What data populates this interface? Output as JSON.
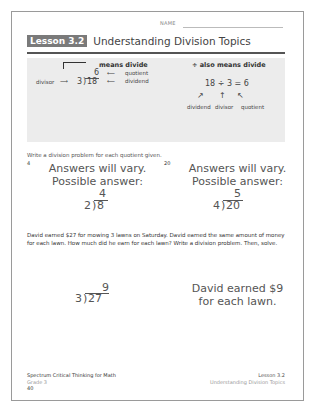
{
  "header": {
    "name_label": "NAME",
    "lesson_badge": "Lesson 3.2",
    "lesson_title": "Understanding Division Topics"
  },
  "info_box": {
    "left": {
      "symbol_label": "means divide",
      "divisor_label": "divisor",
      "divisor": "3",
      "dividend": "18",
      "quotient": "6",
      "quotient_label": "quotient",
      "dividend_label": "dividend"
    },
    "right": {
      "symbol_label": "÷ also means divide",
      "equation": "18 ÷ 3 = 6",
      "labels": [
        "dividend",
        "divisor",
        "quotient"
      ]
    }
  },
  "instruction": "Write a division problem for each quotient given.",
  "problems": [
    {
      "quotient_given": "4",
      "answer_line1": "Answers will vary.",
      "answer_line2": "Possible answer:",
      "quotient": "4",
      "divisor": "2",
      "dividend": "8"
    },
    {
      "quotient_given": "20",
      "answer_line1": "Answers will vary.",
      "answer_line2": "Possible answer:",
      "quotient": "5",
      "divisor": "4",
      "dividend": "20"
    }
  ],
  "word_problem": {
    "text": "David earned $27 for mowing 3 lawns on Saturday. David earned the same amount of money for each lawn. How much did he earn for each lawn? Write a division problem. Then, solve.",
    "quotient": "9",
    "divisor": "3",
    "dividend": "27",
    "answer_line1": "David earned $9",
    "answer_line2": "for each lawn."
  },
  "footer": {
    "book_title": "Spectrum Critical Thinking for Math",
    "grade": "Grade 3",
    "page_number": "40",
    "lesson": "Lesson 3.2",
    "lesson_title": "Understanding Division Topics"
  }
}
